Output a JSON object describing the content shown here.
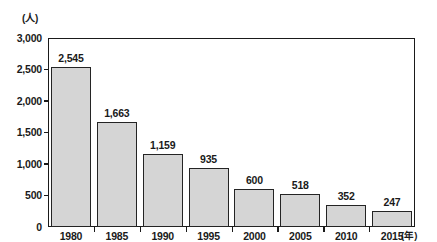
{
  "chart_data": {
    "type": "bar",
    "title": "",
    "subtitle": "",
    "xlabel": "(年)",
    "ylabel": "(人)",
    "categories": [
      "1980",
      "1985",
      "1990",
      "1995",
      "2000",
      "2005",
      "2010",
      "2015"
    ],
    "values": [
      2545,
      1663,
      1159,
      935,
      600,
      518,
      352,
      247
    ],
    "value_labels": [
      "2,545",
      "1,663",
      "1,159",
      "935",
      "600",
      "518",
      "352",
      "247"
    ],
    "ylim": [
      0,
      3000
    ],
    "ytick_values": [
      3000,
      2500,
      2000,
      1500,
      1000,
      500,
      0
    ],
    "ytick_labels": [
      "3,000",
      "2,500",
      "2,000",
      "1,500",
      "1,000",
      "500",
      "0"
    ],
    "grid": false,
    "legend": null,
    "bar_fill_color": "#d5d5d5",
    "bar_edge_color": "#242424",
    "axis_color": "#1a1a1a",
    "series": [
      {
        "name": "人数",
        "values": [
          2545,
          1663,
          1159,
          935,
          600,
          518,
          352,
          247
        ]
      }
    ]
  }
}
